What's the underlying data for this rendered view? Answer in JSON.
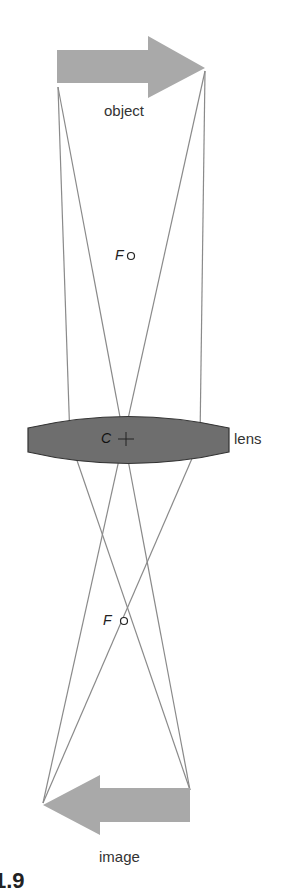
{
  "labels": {
    "object": "object",
    "image": "image",
    "lens": "lens",
    "focal_top": "F",
    "focal_bottom": "F",
    "center": "C",
    "caption_fragment": "1.9"
  },
  "colors": {
    "arrow_fill": "#a9a9a9",
    "lens_fill": "#6e6e6e",
    "lens_stroke": "#333333",
    "ray_stroke": "#8a8a8a",
    "text": "#333333"
  }
}
